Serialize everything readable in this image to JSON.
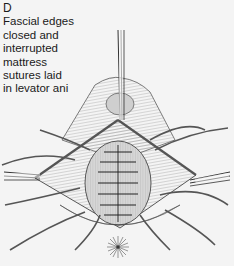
{
  "figure": {
    "panel_label": "D",
    "caption_lines": [
      "Fascial edges",
      "closed and",
      "interrupted",
      "mattress",
      "sutures laid",
      "in levator ani"
    ],
    "colors": {
      "background": "#f4f4f4",
      "ink": "#2a2a2a",
      "tissue_shade": "#b8b8b8",
      "mound_fill": "#d6d6d6"
    }
  }
}
